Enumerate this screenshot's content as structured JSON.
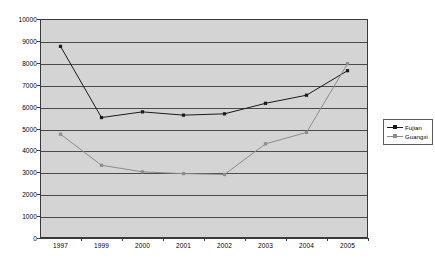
{
  "chart_data": {
    "type": "line",
    "title": "",
    "xlabel": "",
    "ylabel": "",
    "categories": [
      "1997",
      "1999",
      "2000",
      "2001",
      "2002",
      "2003",
      "2004",
      "2005"
    ],
    "ylim": [
      0,
      10000
    ],
    "ytick_step": 1000,
    "yticks": [
      "10000",
      "9000",
      "8000",
      "7000",
      "6000",
      "5000",
      "4000",
      "3000",
      "2000",
      "1000",
      "0"
    ],
    "grid": "horizontal",
    "legend_position": "right",
    "series": [
      {
        "name": "Fujian",
        "color": "#1a1a1a",
        "marker": "square",
        "values": [
          8750,
          5500,
          5760,
          5610,
          5670,
          6150,
          6520,
          7640
        ]
      },
      {
        "name": "Guangxi",
        "color": "#8c8c8c",
        "marker": "square",
        "values": [
          4740,
          3320,
          3020,
          2940,
          2900,
          4300,
          4820,
          7960
        ]
      }
    ]
  },
  "style": {
    "plot_background": "#d4d4d4",
    "page_background": "#ffffff",
    "gridline_color": "#4a4a4a",
    "axis_color": "#3a3a3a"
  }
}
